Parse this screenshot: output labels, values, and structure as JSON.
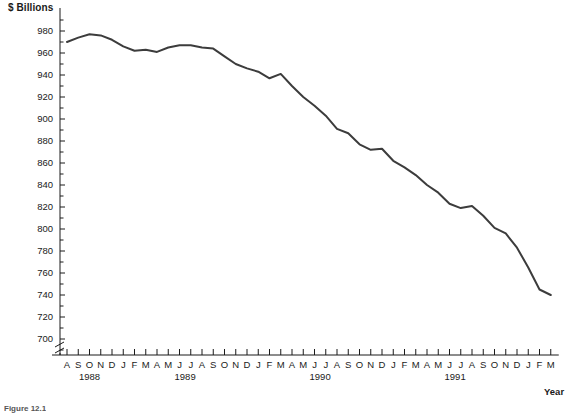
{
  "chart_data": {
    "type": "line",
    "title": "",
    "ylabel": "$ Billions",
    "xlabel": "Year",
    "ylim": [
      690,
      990
    ],
    "yticks": [
      700,
      720,
      740,
      760,
      780,
      800,
      820,
      840,
      860,
      880,
      900,
      920,
      940,
      960,
      980
    ],
    "ytick_minor_step": 10,
    "axis_break": true,
    "grid": false,
    "legend": null,
    "line_color": "#3c3c3c",
    "categories": [
      "A",
      "S",
      "O",
      "N",
      "D",
      "J",
      "F",
      "M",
      "A",
      "M",
      "J",
      "J",
      "A",
      "S",
      "O",
      "N",
      "D",
      "J",
      "F",
      "M",
      "A",
      "M",
      "J",
      "J",
      "A",
      "S",
      "O",
      "N",
      "D",
      "J",
      "F",
      "M",
      "A",
      "M",
      "J",
      "J",
      "A",
      "S",
      "O",
      "N",
      "D",
      "J",
      "F",
      "M"
    ],
    "year_groups": [
      {
        "label": "1988",
        "start_index": 0,
        "end_index": 4
      },
      {
        "label": "1989",
        "start_index": 5,
        "end_index": 16
      },
      {
        "label": "1990",
        "start_index": 17,
        "end_index": 28
      },
      {
        "label": "1991",
        "start_index": 29,
        "end_index": 40
      }
    ],
    "values": [
      970,
      974,
      977,
      976,
      972,
      966,
      962,
      963,
      961,
      965,
      967,
      967,
      965,
      964,
      957,
      950,
      946,
      943,
      937,
      941,
      930,
      920,
      912,
      903,
      891,
      887,
      877,
      872,
      873,
      862,
      856,
      849,
      840,
      833,
      823,
      819,
      821,
      812,
      801,
      796,
      783,
      765,
      745,
      740
    ],
    "values_extent_note": "series ends at index 43",
    "xlabels_last_tick": "M",
    "xlabel_final_year": "1992"
  },
  "labels": {
    "unit_label": "$ Billions",
    "x_axis_title": "Year",
    "figure_caption": "Figure 12.1"
  }
}
